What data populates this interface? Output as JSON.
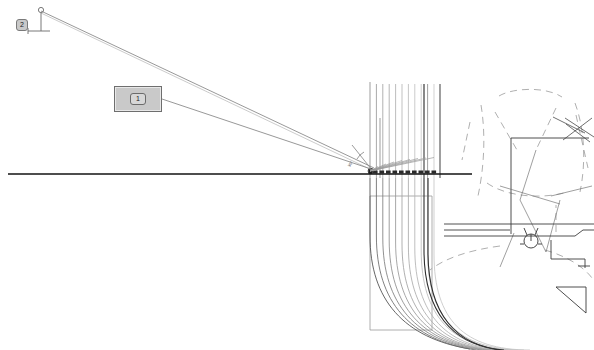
{
  "document": {
    "kind": "cad-drawing-viewport",
    "background_color": "#ffffff",
    "width": 594,
    "height": 350
  },
  "palette": {
    "line_dark": "#1a1a1a",
    "line_mid": "#555555",
    "line_light": "#8a8a8a",
    "line_faint": "#b4b4b4",
    "callout_fill": "#c9c9c9",
    "callout_stroke": "#6e6e6e"
  },
  "callouts": [
    {
      "id": "callout-2",
      "label": "2",
      "style": "chip",
      "x": 16,
      "y": 19,
      "leader_from": [
        41,
        10
      ],
      "leader_to": [
        28,
        30
      ]
    },
    {
      "id": "callout-1",
      "label": "1",
      "style": "plate",
      "x": 114,
      "y": 86,
      "width": 48,
      "height": 26,
      "leader_from": [
        162,
        99
      ],
      "leader_to": [
        372,
        168
      ]
    }
  ],
  "annotations": [
    {
      "id": "angle-dim",
      "text": "35°",
      "x": 352,
      "y": 160,
      "rotation": -62
    }
  ],
  "geometry": {
    "baseline": {
      "x1": 8,
      "y1": 174,
      "x2": 472,
      "y2": 174,
      "weight": 1.4
    },
    "leader_long_upper": {
      "x1": 41,
      "y1": 11,
      "x2": 374,
      "y2": 168
    },
    "leader_long_lower": {
      "x1": 162,
      "y1": 99,
      "x2": 374,
      "y2": 170
    },
    "vertical_bundle": {
      "count": 11,
      "x_start": 370,
      "x_step": 6.4,
      "y_top": 82,
      "y_bottom": 178,
      "note": "parallel vertical strand lines above the baseline"
    },
    "curve_bundle": {
      "count": 11,
      "note": "strands sweeping from vertical down-left around to horizontal lower-right",
      "x_origin": 370,
      "y_origin": 178,
      "radius_start": 118,
      "radius_step": 6.4
    },
    "fan_markers": {
      "count": 11,
      "x_start": 373,
      "x_step": 6.0,
      "y": 173,
      "note": "small dark tick blocks sitting on the baseline"
    },
    "outline_box": {
      "x": 370,
      "y": 196,
      "width": 62,
      "height": 134
    },
    "right_assembly": {
      "solid_rect": {
        "x": 511,
        "y": 138,
        "width": 78,
        "height": 96
      },
      "small_rect": {
        "x": 556,
        "y": 287,
        "width": 30,
        "height": 26
      },
      "hub_circle": {
        "cx": 531,
        "cy": 241,
        "r": 7
      }
    }
  },
  "viewport": {
    "tool": "select",
    "zoom_label": "",
    "status": ""
  }
}
